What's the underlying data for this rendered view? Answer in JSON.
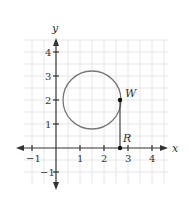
{
  "diagram": {
    "type": "coordinate-plane",
    "axes": {
      "x_label": "x",
      "y_label": "y"
    },
    "x_ticks": [
      "−1",
      "1",
      "2",
      "3",
      "4"
    ],
    "y_ticks": [
      "4",
      "3",
      "2",
      "1",
      "−1"
    ],
    "x_range": [
      -1.5,
      4.5
    ],
    "y_range": [
      -1.5,
      4.5
    ],
    "grid_step": 0.5,
    "circle": {
      "center": [
        1.5,
        2
      ],
      "radius": 1.2
    },
    "points": [
      {
        "label": "W",
        "x": 2.7,
        "y": 2
      },
      {
        "label": "R",
        "x": 2.7,
        "y": 0
      }
    ],
    "segment": {
      "from": "W",
      "to": "R"
    },
    "colors": {
      "grid": "#e4e4e4",
      "axis": "#333333",
      "circle": "#777777"
    }
  }
}
